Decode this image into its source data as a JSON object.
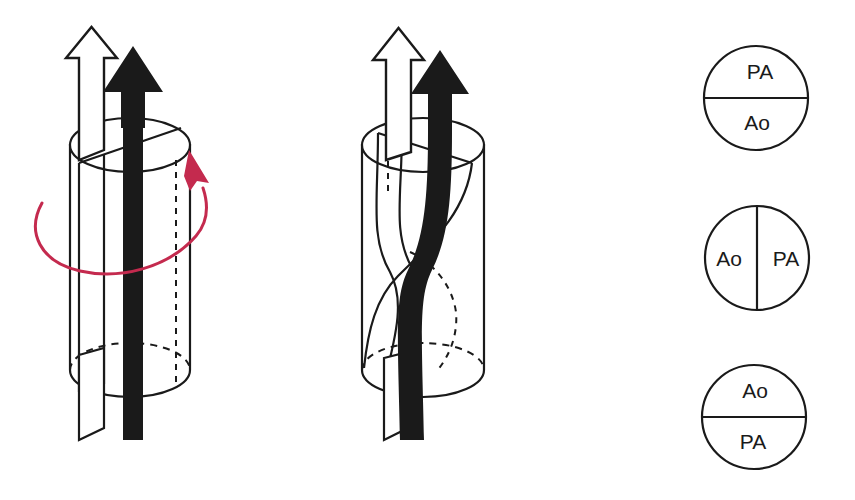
{
  "figure": {
    "background_color": "#ffffff",
    "stroke_color": "#1a1a1a",
    "fill_white": "#ffffff",
    "fill_black": "#1a1a1a",
    "rotation_arrow_color": "#c42a4e"
  },
  "panels": {
    "left": {
      "name": "straight-septum-cylinder",
      "caption": "",
      "has_rotation_arrow": true,
      "septum": "straight",
      "arrows": [
        {
          "id": "white-arrow",
          "style": "outline",
          "direction": "up"
        },
        {
          "id": "black-arrow",
          "style": "solid",
          "direction": "up"
        }
      ]
    },
    "middle": {
      "name": "spiral-septum-cylinder",
      "caption": "",
      "has_rotation_arrow": false,
      "septum": "spiral",
      "arrows": [
        {
          "id": "white-arrow",
          "style": "outline",
          "direction": "up"
        },
        {
          "id": "black-arrow",
          "style": "solid",
          "direction": "up"
        }
      ]
    }
  },
  "cross_sections": [
    {
      "id": "cross-section-top",
      "divider": "horizontal",
      "top_label": "PA",
      "bottom_label": "Ao",
      "left_label": "",
      "right_label": ""
    },
    {
      "id": "cross-section-middle",
      "divider": "vertical",
      "top_label": "",
      "bottom_label": "",
      "left_label": "Ao",
      "right_label": "PA"
    },
    {
      "id": "cross-section-bottom",
      "divider": "horizontal",
      "top_label": "Ao",
      "bottom_label": "PA",
      "left_label": "",
      "right_label": ""
    }
  ]
}
